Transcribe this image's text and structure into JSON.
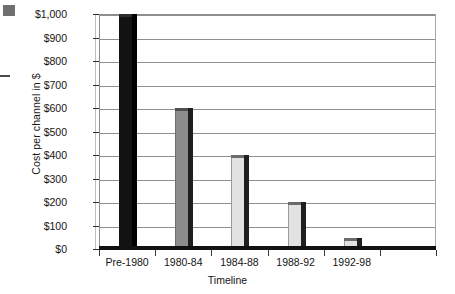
{
  "chart_data": {
    "type": "bar",
    "title": "",
    "xlabel": "Timeline",
    "ylabel": "Cost per channel in $",
    "categories": [
      "Pre-1980",
      "1980-84",
      "1984-88",
      "1988-92",
      "1992-98"
    ],
    "values": [
      1000,
      600,
      400,
      200,
      45
    ],
    "ylim": [
      0,
      1000
    ],
    "ytick_labels": [
      "$1,000",
      "$900",
      "$800",
      "$700",
      "$600",
      "$500",
      "$400",
      "$300",
      "$200",
      "$100",
      "$0"
    ],
    "ytick_values": [
      1000,
      900,
      800,
      700,
      600,
      500,
      400,
      300,
      200,
      100,
      0
    ],
    "grid": "horizontal",
    "legend": "none",
    "bar_styles": [
      "dark",
      "mid",
      "light",
      "light",
      "light"
    ],
    "colors": {
      "bar_dark": "#121212",
      "bar_mid": "#8d8d8d",
      "bar_light": "#e2e2e2",
      "bar_shadow": "#1f1f1f",
      "gridline": "#8f8f8f",
      "axis": "#111111",
      "text": "#141414"
    }
  },
  "artifacts": {
    "corner_mark": "scan-artifact-square",
    "edge_mark": "scan-artifact-dash"
  }
}
